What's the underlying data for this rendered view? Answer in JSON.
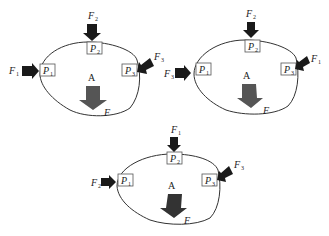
{
  "diagrams": [
    {
      "id": "top-left",
      "body_label": "A",
      "resultant_label": "F",
      "points": [
        {
          "base": "P",
          "sub": "1"
        },
        {
          "base": "P",
          "sub": "2"
        },
        {
          "base": "P",
          "sub": "3"
        }
      ],
      "forces": [
        {
          "base": "F",
          "sub": "1",
          "at": "P1",
          "direction": "right"
        },
        {
          "base": "F",
          "sub": "2",
          "at": "P2",
          "direction": "down"
        },
        {
          "base": "F",
          "sub": "3",
          "at": "P3",
          "direction": "down-left"
        }
      ]
    },
    {
      "id": "top-right",
      "body_label": "A",
      "resultant_label": "F",
      "points": [
        {
          "base": "P",
          "sub": "1"
        },
        {
          "base": "P",
          "sub": "2"
        },
        {
          "base": "P",
          "sub": "3"
        }
      ],
      "forces": [
        {
          "base": "F",
          "sub": "3",
          "at": "P1",
          "direction": "right"
        },
        {
          "base": "F",
          "sub": "2",
          "at": "P2",
          "direction": "down"
        },
        {
          "base": "F",
          "sub": "1",
          "at": "P3",
          "direction": "down-left"
        }
      ]
    },
    {
      "id": "bottom",
      "body_label": "A",
      "resultant_label": "F",
      "points": [
        {
          "base": "P",
          "sub": "1"
        },
        {
          "base": "P",
          "sub": "2"
        },
        {
          "base": "P",
          "sub": "3"
        }
      ],
      "forces": [
        {
          "base": "F",
          "sub": "2",
          "at": "P1",
          "direction": "right"
        },
        {
          "base": "F",
          "sub": "1",
          "at": "P2",
          "direction": "down"
        },
        {
          "base": "F",
          "sub": "3",
          "at": "P3",
          "direction": "down-left"
        }
      ]
    }
  ],
  "colors": {
    "outline": "#333333",
    "arrow_dark": "#1a1a1a",
    "arrow_resultant": "#555555"
  }
}
